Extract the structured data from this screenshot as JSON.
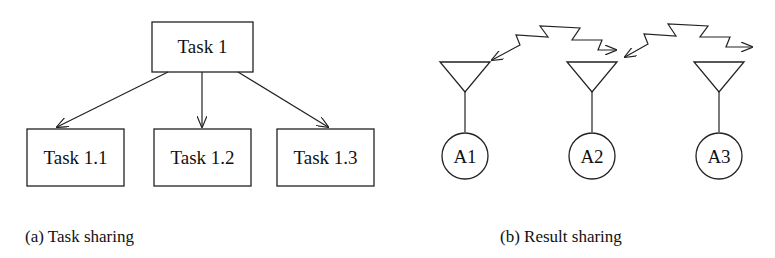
{
  "panel_a": {
    "caption": "(a) Task sharing",
    "root": {
      "label": "Task 1"
    },
    "children": [
      {
        "label": "Task 1.1"
      },
      {
        "label": "Task 1.2"
      },
      {
        "label": "Task 1.3"
      }
    ]
  },
  "panel_b": {
    "caption": "(b) Result sharing",
    "agents": [
      {
        "label": "A1"
      },
      {
        "label": "A2"
      },
      {
        "label": "A3"
      }
    ],
    "links": [
      {
        "from": "A1",
        "to": "A2",
        "type": "bidirectional-zigzag-arrow"
      },
      {
        "from": "A2",
        "to": "A3",
        "type": "bidirectional-zigzag-arrow"
      }
    ]
  },
  "colors": {
    "stroke": "#222222",
    "background": "#ffffff",
    "text": "#111111"
  }
}
